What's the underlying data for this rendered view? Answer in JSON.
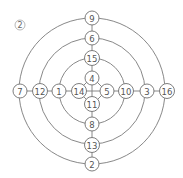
{
  "figure": {
    "label": "2",
    "center": [
      92,
      91
    ]
  },
  "rings": [
    {
      "name": "inner-diamond",
      "type": "diamond",
      "radius": 14
    },
    {
      "name": "ring-1",
      "type": "circle",
      "radius": 33
    },
    {
      "name": "ring-2",
      "type": "circle",
      "radius": 53
    },
    {
      "name": "ring-3",
      "type": "circle",
      "radius": 73
    }
  ],
  "nodes": [
    {
      "label": "9",
      "x": 92,
      "y": 18
    },
    {
      "label": "6",
      "x": 92,
      "y": 38
    },
    {
      "label": "15",
      "x": 92,
      "y": 58
    },
    {
      "label": "4",
      "x": 92,
      "y": 78
    },
    {
      "label": "11",
      "x": 92,
      "y": 104
    },
    {
      "label": "8",
      "x": 92,
      "y": 124
    },
    {
      "label": "13",
      "x": 92,
      "y": 145
    },
    {
      "label": "2",
      "x": 92,
      "y": 164
    },
    {
      "label": "7",
      "x": 20,
      "y": 91
    },
    {
      "label": "12",
      "x": 40,
      "y": 91
    },
    {
      "label": "1",
      "x": 59,
      "y": 91
    },
    {
      "label": "14",
      "x": 79,
      "y": 91
    },
    {
      "label": "5",
      "x": 107,
      "y": 91
    },
    {
      "label": "10",
      "x": 126,
      "y": 91
    },
    {
      "label": "3",
      "x": 147,
      "y": 91
    },
    {
      "label": "16",
      "x": 167,
      "y": 91
    }
  ],
  "style": {
    "line_color": "#7a7a7a",
    "text_color": "#555555",
    "background": "#ffffff"
  }
}
